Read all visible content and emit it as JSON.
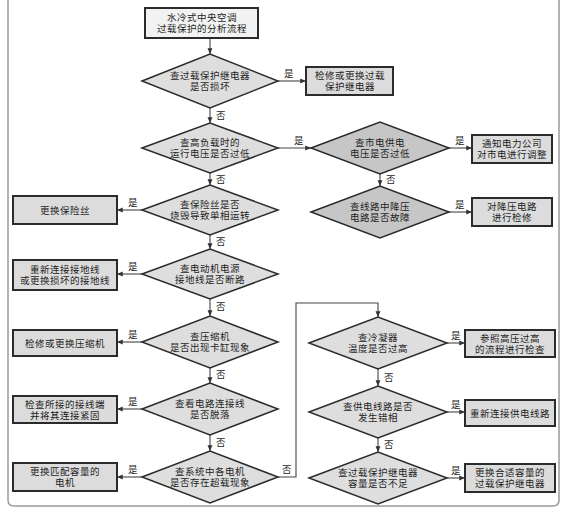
{
  "diagram": {
    "title_lines": [
      "水冷式中央空调",
      "过载保护的分析流程"
    ],
    "yes_label": "是",
    "no_label": "否",
    "nodes": [
      {
        "id": "start",
        "type": "start",
        "x": 145,
        "y": 8,
        "w": 113,
        "h": 30,
        "lines": [
          "水冷式中央空调",
          "过载保护的分析流程"
        ]
      },
      {
        "id": "d1",
        "type": "decision",
        "shade": "light",
        "cx": 210,
        "cy": 81,
        "hw": 68,
        "hh": 27,
        "lines": [
          "查过载保护继电器",
          "是否损坏"
        ]
      },
      {
        "id": "a1",
        "type": "action",
        "x": 306,
        "y": 67,
        "w": 87,
        "h": 28,
        "lines": [
          "检修或更换过载",
          "保护继电器"
        ]
      },
      {
        "id": "d2",
        "type": "decision",
        "shade": "light",
        "cx": 210,
        "cy": 148,
        "hw": 68,
        "hh": 25,
        "lines": [
          "查高负载时的",
          "运行电压是否过低"
        ]
      },
      {
        "id": "d2r",
        "type": "decision",
        "shade": "dark",
        "cx": 380,
        "cy": 148,
        "hw": 69,
        "hh": 26,
        "lines": [
          "查市电供电",
          "电压是否过低"
        ]
      },
      {
        "id": "a2r",
        "type": "action",
        "x": 472,
        "y": 135,
        "w": 80,
        "h": 28,
        "lines": [
          "通知电力公司",
          "对市电进行调整"
        ]
      },
      {
        "id": "d3",
        "type": "decision",
        "shade": "light",
        "cx": 210,
        "cy": 210,
        "hw": 68,
        "hh": 25,
        "lines": [
          "查保险丝是否",
          "烧毁导致单相运转"
        ]
      },
      {
        "id": "a3",
        "type": "action",
        "x": 13,
        "y": 196,
        "w": 104,
        "h": 28,
        "lines": [
          "更换保险丝"
        ]
      },
      {
        "id": "d3r",
        "type": "decision",
        "shade": "dark",
        "cx": 380,
        "cy": 212,
        "hw": 69,
        "hh": 26,
        "lines": [
          "查线路中降压",
          "电路是否故障"
        ]
      },
      {
        "id": "a3r",
        "type": "action",
        "x": 472,
        "y": 198,
        "w": 80,
        "h": 28,
        "lines": [
          "对降压电路",
          "进行检修"
        ]
      },
      {
        "id": "d4",
        "type": "decision",
        "shade": "light",
        "cx": 210,
        "cy": 274,
        "hw": 68,
        "hh": 25,
        "lines": [
          "查电动机电源",
          "接地线是否断路"
        ]
      },
      {
        "id": "a4",
        "type": "action",
        "x": 13,
        "y": 260,
        "w": 104,
        "h": 30,
        "lines": [
          "重新连接接地线",
          "或更换损坏的接地线"
        ]
      },
      {
        "id": "d5",
        "type": "decision",
        "shade": "light",
        "cx": 210,
        "cy": 342,
        "hw": 68,
        "hh": 26,
        "lines": [
          "查压缩机",
          "是否出现卡缸现象"
        ]
      },
      {
        "id": "a5",
        "type": "action",
        "x": 13,
        "y": 330,
        "w": 104,
        "h": 26,
        "lines": [
          "检修或更换压缩机"
        ]
      },
      {
        "id": "d6",
        "type": "decision",
        "shade": "light",
        "cx": 210,
        "cy": 409,
        "hw": 68,
        "hh": 26,
        "lines": [
          "查看电路连接线",
          "是否脱落"
        ]
      },
      {
        "id": "a6",
        "type": "action",
        "x": 13,
        "y": 396,
        "w": 104,
        "h": 27,
        "lines": [
          "检查所接的接线端",
          "并将其连接紧固"
        ]
      },
      {
        "id": "d7",
        "type": "decision",
        "shade": "light",
        "cx": 210,
        "cy": 477,
        "hw": 68,
        "hh": 26,
        "lines": [
          "查系统中各电机",
          "是否存在超载现象"
        ]
      },
      {
        "id": "a7",
        "type": "action",
        "x": 13,
        "y": 463,
        "w": 104,
        "h": 28,
        "lines": [
          "更换匹配容量的",
          "电机"
        ]
      },
      {
        "id": "d8",
        "type": "decision",
        "shade": "light",
        "cx": 378,
        "cy": 343,
        "hw": 69,
        "hh": 26,
        "lines": [
          "查冷凝器",
          "温度是否过高"
        ]
      },
      {
        "id": "a8",
        "type": "action",
        "x": 465,
        "y": 330,
        "w": 90,
        "h": 27,
        "lines": [
          "参照高压过高",
          "的流程进行检查"
        ]
      },
      {
        "id": "d9",
        "type": "decision",
        "shade": "light",
        "cx": 378,
        "cy": 412,
        "hw": 69,
        "hh": 26,
        "lines": [
          "查供电线路是否",
          "发生错相"
        ]
      },
      {
        "id": "a9",
        "type": "action",
        "x": 465,
        "y": 400,
        "w": 90,
        "h": 26,
        "lines": [
          "重新连接供电线路"
        ]
      },
      {
        "id": "d10",
        "type": "decision",
        "shade": "light",
        "cx": 378,
        "cy": 478,
        "hw": 69,
        "hh": 26,
        "lines": [
          "查过载保护继电器",
          "容量是否不足"
        ]
      },
      {
        "id": "a10",
        "type": "action",
        "x": 465,
        "y": 464,
        "w": 90,
        "h": 28,
        "lines": [
          "更换合适容量的",
          "过载保护继电器"
        ]
      }
    ],
    "edges": [
      {
        "from": "start",
        "to": "d1",
        "label": "",
        "points": [
          [
            210,
            38
          ],
          [
            210,
            54
          ]
        ]
      },
      {
        "from": "d1",
        "to": "a1",
        "label": "是",
        "points": [
          [
            278,
            81
          ],
          [
            306,
            81
          ]
        ],
        "lx": 284,
        "ly": 77
      },
      {
        "from": "d1",
        "to": "d2",
        "label": "否",
        "points": [
          [
            210,
            108
          ],
          [
            210,
            123
          ]
        ],
        "lx": 216,
        "ly": 119
      },
      {
        "from": "d2",
        "to": "d2r",
        "label": "是",
        "points": [
          [
            278,
            148
          ],
          [
            311,
            148
          ]
        ],
        "lx": 294,
        "ly": 144
      },
      {
        "from": "d2r",
        "to": "a2r",
        "label": "是",
        "points": [
          [
            449,
            148
          ],
          [
            472,
            148
          ]
        ],
        "lx": 455,
        "ly": 144
      },
      {
        "from": "d2r",
        "to": "d3r",
        "label": "否",
        "points": [
          [
            380,
            174
          ],
          [
            380,
            186
          ]
        ],
        "lx": 386,
        "ly": 183
      },
      {
        "from": "d3r",
        "to": "a3r",
        "label": "是",
        "points": [
          [
            449,
            212
          ],
          [
            472,
            212
          ]
        ],
        "lx": 455,
        "ly": 208
      },
      {
        "from": "d2",
        "to": "d3",
        "label": "否",
        "points": [
          [
            210,
            173
          ],
          [
            210,
            185
          ]
        ],
        "lx": 216,
        "ly": 183
      },
      {
        "from": "d3",
        "to": "a3",
        "label": "是",
        "points": [
          [
            142,
            210
          ],
          [
            117,
            210
          ]
        ],
        "lx": 128,
        "ly": 206
      },
      {
        "from": "d3",
        "to": "d4",
        "label": "否",
        "points": [
          [
            210,
            235
          ],
          [
            210,
            249
          ]
        ],
        "lx": 216,
        "ly": 245
      },
      {
        "from": "d4",
        "to": "a4",
        "label": "是",
        "points": [
          [
            142,
            274
          ],
          [
            117,
            274
          ]
        ],
        "lx": 128,
        "ly": 270
      },
      {
        "from": "d4",
        "to": "d5",
        "label": "否",
        "points": [
          [
            210,
            299
          ],
          [
            210,
            316
          ]
        ],
        "lx": 216,
        "ly": 310
      },
      {
        "from": "d5",
        "to": "a5",
        "label": "是",
        "points": [
          [
            142,
            342
          ],
          [
            117,
            342
          ]
        ],
        "lx": 128,
        "ly": 338
      },
      {
        "from": "d5",
        "to": "d6",
        "label": "否",
        "points": [
          [
            210,
            368
          ],
          [
            210,
            383
          ]
        ],
        "lx": 216,
        "ly": 378
      },
      {
        "from": "d6",
        "to": "a6",
        "label": "是",
        "points": [
          [
            142,
            409
          ],
          [
            117,
            409
          ]
        ],
        "lx": 128,
        "ly": 405
      },
      {
        "from": "d6",
        "to": "d7",
        "label": "否",
        "points": [
          [
            210,
            435
          ],
          [
            210,
            451
          ]
        ],
        "lx": 216,
        "ly": 446
      },
      {
        "from": "d7",
        "to": "a7",
        "label": "是",
        "points": [
          [
            142,
            477
          ],
          [
            117,
            477
          ]
        ],
        "lx": 128,
        "ly": 473
      },
      {
        "from": "d7",
        "to": "d8",
        "label": "否",
        "points": [
          [
            278,
            477
          ],
          [
            296,
            477
          ],
          [
            296,
            303
          ],
          [
            378,
            303
          ],
          [
            378,
            317
          ]
        ],
        "lx": 282,
        "ly": 473
      },
      {
        "from": "d8",
        "to": "a8",
        "label": "是",
        "points": [
          [
            447,
            343
          ],
          [
            465,
            343
          ]
        ],
        "lx": 451,
        "ly": 339
      },
      {
        "from": "d8",
        "to": "d9",
        "label": "否",
        "points": [
          [
            378,
            369
          ],
          [
            378,
            386
          ]
        ],
        "lx": 384,
        "ly": 381
      },
      {
        "from": "d9",
        "to": "a9",
        "label": "是",
        "points": [
          [
            447,
            412
          ],
          [
            465,
            412
          ]
        ],
        "lx": 451,
        "ly": 408
      },
      {
        "from": "d9",
        "to": "d10",
        "label": "否",
        "points": [
          [
            378,
            438
          ],
          [
            378,
            452
          ]
        ],
        "lx": 384,
        "ly": 448
      },
      {
        "from": "d10",
        "to": "a10",
        "label": "是",
        "points": [
          [
            447,
            478
          ],
          [
            465,
            478
          ]
        ],
        "lx": 451,
        "ly": 474
      }
    ]
  }
}
